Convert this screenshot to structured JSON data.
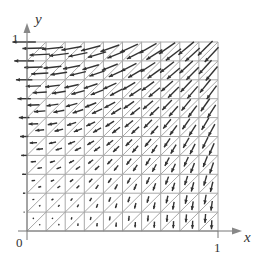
{
  "figure": {
    "type": "vector-field-on-triangulated-grid",
    "grid": {
      "cols": 10,
      "rows": 10,
      "x_range": [
        0,
        1
      ],
      "y_range": [
        0,
        1
      ],
      "diagonals": "bottom-left-to-top-right"
    },
    "colors": {
      "grid": "#a8a8a8",
      "axis": "#777777",
      "arrow": "#333333",
      "background": "#ffffff"
    },
    "axes": {
      "x_label": "x",
      "y_label": "y",
      "origin_label": "0",
      "x_tick_label": "1",
      "y_tick_label": "1"
    },
    "field_description": "Arrows point generally toward lower-left; horizontal (leftward) along x=0, vertical (downward) along y=0; magnitude largest near top-left, near zero at origin."
  }
}
